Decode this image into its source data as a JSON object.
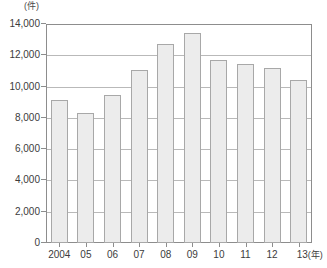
{
  "chart_data": {
    "type": "bar",
    "title": "",
    "subtitle": "",
    "unit_label": "(件)",
    "xlabel": "(年)",
    "ylabel": "",
    "categories": [
      "2004",
      "05",
      "06",
      "07",
      "08",
      "09",
      "10",
      "11",
      "12",
      "13"
    ],
    "values": [
      9150,
      8300,
      9450,
      11050,
      12750,
      13450,
      11700,
      11450,
      11200,
      10400
    ],
    "ylim": [
      0,
      14000
    ],
    "ytick_labels": [
      "14,000",
      "12,000",
      "10,000",
      "8,000",
      "6,000",
      "4,000",
      "2,000",
      "0"
    ],
    "ytick_values": [
      14000,
      12000,
      10000,
      8000,
      6000,
      4000,
      2000,
      0
    ],
    "grid": true,
    "grid_axis": "y",
    "legend": null,
    "legend_position": "none",
    "series": [
      {
        "name": "件数",
        "values": [
          9150,
          8300,
          9450,
          11050,
          12750,
          13450,
          11700,
          11450,
          11200,
          10400
        ]
      }
    ],
    "colors": {
      "bar_fill": "#ececec",
      "bar_border": "#a8a8a8",
      "gridline": "#b9b9b9",
      "axis": "#8d8d8d",
      "text": "#3c3c3c",
      "background": "#ffffff"
    }
  }
}
